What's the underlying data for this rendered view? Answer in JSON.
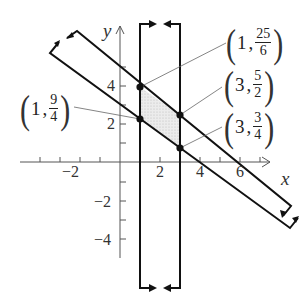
{
  "diagram": {
    "axes": {
      "x_label": "x",
      "y_label": "y",
      "x_ticks": [
        {
          "value": -2,
          "label": "−2"
        },
        {
          "value": 2,
          "label": "2"
        },
        {
          "value": 4,
          "label": "4"
        },
        {
          "value": 6,
          "label": "6"
        }
      ],
      "y_ticks": [
        {
          "value": 4,
          "label": "4"
        },
        {
          "value": 2,
          "label": "2"
        },
        {
          "value": -2,
          "label": "−2"
        },
        {
          "value": -4,
          "label": "−4"
        }
      ]
    },
    "points": [
      {
        "id": "p1",
        "x": "1",
        "y_num": "25",
        "y_den": "6"
      },
      {
        "id": "p2",
        "x": "1",
        "y_num": "9",
        "y_den": "4"
      },
      {
        "id": "p3",
        "x": "3",
        "y_num": "5",
        "y_den": "2"
      },
      {
        "id": "p4",
        "x": "3",
        "y_num": "3",
        "y_den": "4"
      }
    ],
    "colors": {
      "line": "#111111",
      "shade": "#e4e4e4",
      "axis": "#555555",
      "leader": "#666666"
    }
  }
}
